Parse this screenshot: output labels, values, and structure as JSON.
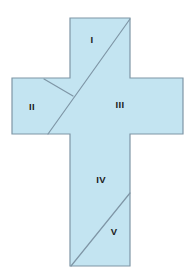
{
  "figure": {
    "background_color": "#ffffff",
    "fill_color": "#c3e4f1",
    "stroke_color": "#7f96a6",
    "label_color": "#1b1b1b",
    "outline": {
      "name": "latin-cross",
      "points": "70,18 130,18 130,78 183,78 183,134 130,134 130,266 70,266 70,134 12,134 12,78 70,78"
    },
    "cut_lines": [
      {
        "name": "main-diagonal",
        "x1": 130,
        "y1": 19,
        "x2": 48,
        "y2": 134
      },
      {
        "name": "short-diagonal",
        "x1": 44,
        "y1": 79,
        "x2": 73,
        "y2": 96
      },
      {
        "name": "lower-diagonal",
        "x1": 130,
        "y1": 193,
        "x2": 71,
        "y2": 266
      }
    ],
    "regions": [
      {
        "id": "region-1",
        "label": "I",
        "x": 92,
        "y": 40
      },
      {
        "id": "region-2",
        "label": "II",
        "x": 32,
        "y": 107
      },
      {
        "id": "region-3",
        "label": "III",
        "x": 120,
        "y": 105
      },
      {
        "id": "region-4",
        "label": "IV",
        "x": 101,
        "y": 180
      },
      {
        "id": "region-5",
        "label": "V",
        "x": 114,
        "y": 232
      }
    ]
  }
}
